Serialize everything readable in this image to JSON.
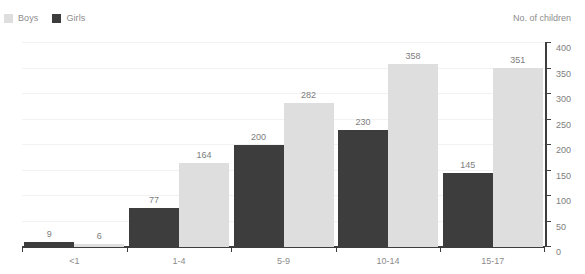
{
  "legend": {
    "position": "top-left",
    "entries": [
      {
        "label": "Boys",
        "color": "#dedede"
      },
      {
        "label": "Girls",
        "color": "#3d3d3d"
      }
    ]
  },
  "axis_title": "No. of children",
  "chart_data": {
    "type": "bar",
    "title": "",
    "subtitle": "",
    "xlabel": "",
    "ylabel": "No. of children",
    "categories": [
      "<1",
      "1-4",
      "5-9",
      "10-14",
      "15-17"
    ],
    "series": [
      {
        "name": "Girls",
        "color": "#3d3d3d",
        "values": [
          9,
          77,
          200,
          230,
          145
        ]
      },
      {
        "name": "Boys",
        "color": "#dedede",
        "values": [
          6,
          164,
          282,
          358,
          351
        ]
      }
    ],
    "ylim": [
      0,
      400
    ],
    "yticks": [
      0,
      50,
      100,
      150,
      200,
      250,
      300,
      350,
      400
    ],
    "ytick_labels": [
      "0",
      "50",
      "100",
      "150",
      "200",
      "250",
      "300",
      "350",
      "400"
    ],
    "grid": true,
    "grid_axis": "y",
    "y_axis_position": "right",
    "data_labels": true,
    "legend_position": "top-left",
    "bar_order": [
      "Girls",
      "Boys"
    ]
  }
}
